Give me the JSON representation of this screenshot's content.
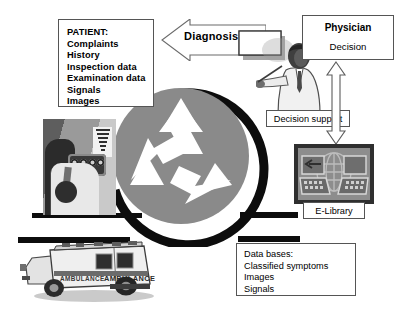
{
  "diagram": {
    "background_color": "#ffffff",
    "accent_gray": "#8a8a8a",
    "line_color": "#0d0d0d"
  },
  "patient_box": {
    "name": "PATIENT:",
    "lines": [
      "PATIENT:",
      "Complaints",
      "History",
      "Inspection data",
      "Examination data",
      "Signals",
      "Images"
    ]
  },
  "diagnosis_arrow": {
    "label": "Diagnosis",
    "direction": "left"
  },
  "physician_box": {
    "title": "Physician",
    "subtitle": "Decision"
  },
  "decision_support": {
    "label": "Decision support"
  },
  "elibrary": {
    "label": "E-Library"
  },
  "databases_box": {
    "lines": [
      "Data bases:",
      "Classified symptoms",
      "Images",
      "Signals"
    ]
  },
  "ambulance": {
    "body_text_left": "AMBULANCE",
    "body_text_right": "AMBULANCE"
  },
  "center": {
    "symbol": "recycling-symbol",
    "circle_color": "#8a8a8a",
    "arc_color": "#0d0d0d"
  },
  "connectors": {
    "vertical_double_arrow": "double-headed"
  }
}
